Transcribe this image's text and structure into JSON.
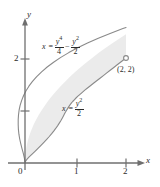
{
  "figure": {
    "type": "region-between-curves-diagram"
  },
  "axes": {
    "x_axis_label": "x",
    "y_axis_label": "y",
    "origin_label": "0",
    "x_ticks": [
      {
        "value": 1,
        "label": "1"
      },
      {
        "value": 2,
        "label": "2"
      }
    ],
    "y_ticks": [
      {
        "value": 1,
        "label": ""
      },
      {
        "value": 2,
        "label": "2"
      }
    ],
    "xlim": [
      -0.5,
      2.6
    ],
    "ylim": [
      -0.3,
      2.85
    ]
  },
  "curves": [
    {
      "name": "upper-curve",
      "equation_text": "x = y⁴/4 − y²/2",
      "lhs_variable": "x",
      "relation": "=",
      "term1": {
        "numerator": "y",
        "numerator_exponent": "4",
        "denominator": "4"
      },
      "operator": "−",
      "term2": {
        "numerator": "y",
        "numerator_exponent": "2",
        "denominator": "2"
      }
    },
    {
      "name": "lower-curve",
      "equation_text": "x = y²/2",
      "lhs_variable": "x",
      "relation": "=",
      "term1": {
        "numerator": "y",
        "numerator_exponent": "2",
        "denominator": "2"
      }
    }
  ],
  "points": [
    {
      "name": "intersection-point",
      "label": "(2, 2)",
      "x": 2,
      "y": 2
    }
  ],
  "colors": {
    "region_fill": "#ebebeb",
    "curve_stroke": "#8a8a8a",
    "axis_stroke": "#6f6f6f",
    "text": "#2b2b2b"
  }
}
